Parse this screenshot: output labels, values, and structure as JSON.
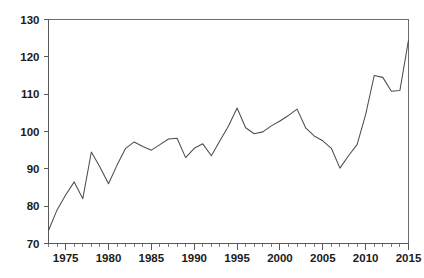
{
  "chart_data": {
    "type": "line",
    "title": "",
    "subtitle": "",
    "xlabel": "",
    "ylabel": "",
    "xlim": [
      1973,
      2015
    ],
    "ylim": [
      70,
      130
    ],
    "grid": false,
    "legend": null,
    "series_name": "",
    "line_color": "#4d4d50",
    "y_ticks": [
      70,
      80,
      90,
      100,
      110,
      120,
      130
    ],
    "y_tick_labels": [
      "70",
      "80",
      "90",
      "100",
      "110",
      "120",
      "130"
    ],
    "x_ticks": [
      1975,
      1980,
      1985,
      1990,
      1995,
      2000,
      2005,
      2010,
      2015
    ],
    "x_tick_labels": [
      "1975",
      "1980",
      "1985",
      "1990",
      "1995",
      "2000",
      "2005",
      "2010",
      "2015"
    ],
    "x_minor_tick_step": 1,
    "x": [
      1973,
      1974,
      1975,
      1976,
      1977,
      1978,
      1979,
      1980,
      1981,
      1982,
      1983,
      1984,
      1985,
      1986,
      1987,
      1988,
      1989,
      1990,
      1991,
      1992,
      1993,
      1994,
      1995,
      1996,
      1997,
      1998,
      1999,
      2000,
      2001,
      2002,
      2003,
      2004,
      2005,
      2006,
      2007,
      2008,
      2009,
      2010,
      2011,
      2012,
      2013,
      2014,
      2015
    ],
    "values": [
      73.5,
      79.0,
      83.0,
      86.5,
      82.0,
      94.5,
      90.5,
      86.0,
      91.0,
      95.5,
      97.2,
      96.0,
      95.0,
      96.5,
      98.0,
      98.2,
      93.0,
      95.5,
      96.7,
      93.5,
      97.5,
      101.5,
      106.3,
      101.0,
      99.4,
      99.9,
      101.5,
      102.8,
      104.3,
      106.0,
      101.0,
      98.8,
      97.5,
      95.5,
      90.2,
      93.5,
      96.5,
      104.5,
      115.0,
      114.5,
      110.8,
      111.0,
      124.5
    ],
    "annotations": []
  },
  "axis": {
    "y_label_00": "70",
    "y_label_01": "80",
    "y_label_02": "90",
    "y_label_03": "100",
    "y_label_04": "110",
    "y_label_05": "120",
    "y_label_06": "130",
    "x_label_00": "1975",
    "x_label_01": "1980",
    "x_label_02": "1985",
    "x_label_03": "1990",
    "x_label_04": "1995",
    "x_label_05": "2000",
    "x_label_06": "2005",
    "x_label_07": "2010",
    "x_label_08": "2015"
  }
}
